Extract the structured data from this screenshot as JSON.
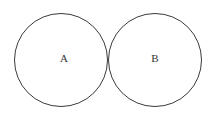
{
  "figure": {
    "type": "geometry-diagram",
    "background_color": "#ffffff",
    "stroke_color": "#3a3a3a",
    "label_color": "#333333",
    "width": 214,
    "height": 113
  },
  "clipped_caption": {
    "text": "………  ·  ·  ··  ·",
    "note": "row of faint glyph remnants clipped at top edge",
    "color": "#9aa0b0"
  },
  "shapes": {
    "circles": [
      {
        "id": "circle-a",
        "label": "A",
        "cx": 61,
        "cy": 60,
        "r": 46.5,
        "label_x": 64,
        "label_y": 59
      },
      {
        "id": "circle-b",
        "label": "B",
        "cx": 155,
        "cy": 60,
        "r": 46.5,
        "label_x": 155,
        "label_y": 59
      }
    ],
    "tangent_point": {
      "x": 108,
      "y": 60
    }
  }
}
